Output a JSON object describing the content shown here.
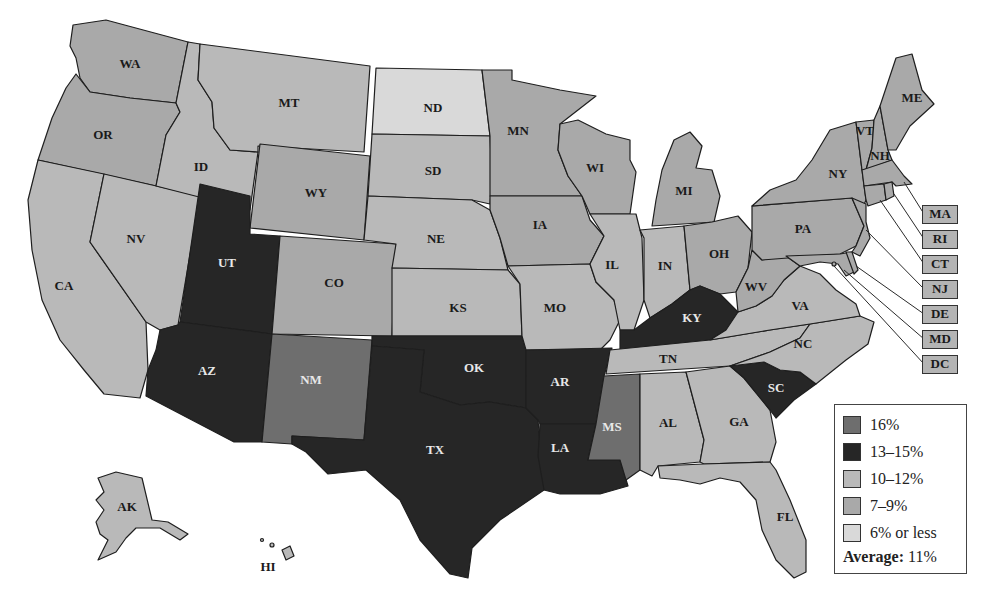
{
  "map": {
    "type": "choropleth",
    "subject": "United States by state",
    "legend": {
      "items": [
        {
          "label": "16%",
          "color": "#6e6e6e"
        },
        {
          "label": "13–15%",
          "color": "#262626"
        },
        {
          "label": "10–12%",
          "color": "#b9b9b9"
        },
        {
          "label": "7–9%",
          "color": "#a9a9a9"
        },
        {
          "label": "6% or less",
          "color": "#d9d9d9"
        }
      ],
      "average_label": "Average:",
      "average_value": "11%"
    },
    "states": {
      "WA": "7–9%",
      "OR": "7–9%",
      "CA": "10–12%",
      "NV": "10–12%",
      "ID": "10–12%",
      "MT": "10–12%",
      "WY": "7–9%",
      "UT": "13–15%",
      "AZ": "13–15%",
      "CO": "7–9%",
      "NM": "16%",
      "ND": "6% or less",
      "SD": "10–12%",
      "NE": "10–12%",
      "KS": "10–12%",
      "OK": "13–15%",
      "TX": "13–15%",
      "MN": "7–9%",
      "IA": "7–9%",
      "MO": "10–12%",
      "AR": "13–15%",
      "LA": "13–15%",
      "WI": "7–9%",
      "IL": "10–12%",
      "MS": "16%",
      "MI": "7–9%",
      "IN": "10–12%",
      "KY": "13–15%",
      "TN": "10–12%",
      "AL": "10–12%",
      "OH": "7–9%",
      "WV": "7–9%",
      "GA": "10–12%",
      "FL": "10–12%",
      "SC": "13–15%",
      "NC": "10–12%",
      "VA": "10–12%",
      "PA": "7–9%",
      "NY": "7–9%",
      "VT": "7–9%",
      "NH": "7–9%",
      "ME": "7–9%",
      "MA": "7–9%",
      "RI": "7–9%",
      "CT": "7–9%",
      "NJ": "7–9%",
      "DE": "7–9%",
      "MD": "7–9%",
      "DC": "7–9%",
      "AK": "10–12%",
      "HI": "10–12%"
    },
    "labels": {
      "WA": "WA",
      "OR": "OR",
      "CA": "CA",
      "NV": "NV",
      "ID": "ID",
      "MT": "MT",
      "WY": "WY",
      "UT": "UT",
      "AZ": "AZ",
      "CO": "CO",
      "NM": "NM",
      "ND": "ND",
      "SD": "SD",
      "NE": "NE",
      "KS": "KS",
      "OK": "OK",
      "TX": "TX",
      "MN": "MN",
      "IA": "IA",
      "MO": "MO",
      "AR": "AR",
      "LA": "LA",
      "WI": "WI",
      "IL": "IL",
      "MS": "MS",
      "MI": "MI",
      "IN": "IN",
      "KY": "KY",
      "TN": "TN",
      "AL": "AL",
      "OH": "OH",
      "WV": "WV",
      "GA": "GA",
      "FL": "FL",
      "SC": "SC",
      "NC": "NC",
      "VA": "VA",
      "PA": "PA",
      "NY": "NY",
      "VT": "VT",
      "NH": "NH",
      "ME": "ME",
      "AK": "AK",
      "HI": "HI"
    },
    "callouts": [
      "MA",
      "RI",
      "CT",
      "NJ",
      "DE",
      "MD",
      "DC"
    ]
  }
}
